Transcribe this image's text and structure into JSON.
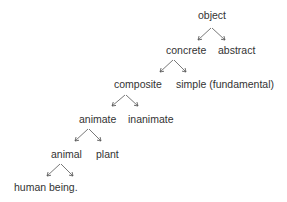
{
  "diagram": {
    "type": "tree",
    "nodes": [
      {
        "id": "object",
        "label": "object",
        "x": 198,
        "y": 9
      },
      {
        "id": "concrete",
        "label": "concrete",
        "x": 166,
        "y": 44
      },
      {
        "id": "abstract",
        "label": "abstract",
        "x": 218,
        "y": 44
      },
      {
        "id": "composite",
        "label": "composite",
        "x": 114,
        "y": 78
      },
      {
        "id": "simple",
        "label": "simple (fundamental)",
        "x": 176,
        "y": 78
      },
      {
        "id": "animate",
        "label": "animate",
        "x": 79,
        "y": 113
      },
      {
        "id": "inanimate",
        "label": "inanimate",
        "x": 128,
        "y": 113
      },
      {
        "id": "animal",
        "label": "animal",
        "x": 51,
        "y": 148
      },
      {
        "id": "plant",
        "label": "plant",
        "x": 96,
        "y": 148
      },
      {
        "id": "human",
        "label": "human being.",
        "x": 14,
        "y": 181
      }
    ],
    "edges": [
      {
        "from": "object",
        "to": "concrete"
      },
      {
        "from": "object",
        "to": "abstract"
      },
      {
        "from": "concrete",
        "to": "composite"
      },
      {
        "from": "concrete",
        "to": "simple"
      },
      {
        "from": "composite",
        "to": "animate"
      },
      {
        "from": "composite",
        "to": "inanimate"
      },
      {
        "from": "animate",
        "to": "animal"
      },
      {
        "from": "animate",
        "to": "plant"
      },
      {
        "from": "animal",
        "to": "human"
      },
      {
        "from": "animal",
        "to": null
      }
    ],
    "colors": {
      "text": "#333333",
      "arrow": "#555555",
      "background": "#ffffff"
    }
  }
}
